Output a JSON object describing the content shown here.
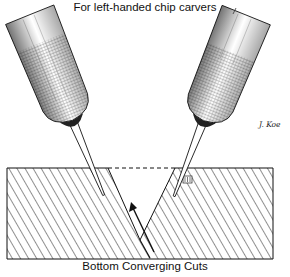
{
  "figure": {
    "title": "For left-handed chip carvers",
    "caption": "Bottom Converging Cuts",
    "signature": "J. Koe",
    "colors": {
      "ink": "#111111",
      "paper": "#ffffff"
    },
    "elements": [
      {
        "name": "left-knife",
        "description": "Knife handle tilted, blade pointing down-right into wood"
      },
      {
        "name": "right-knife",
        "description": "Knife handle tilted, blade pointing down-left into wood"
      },
      {
        "name": "wood-block",
        "description": "Hatched cross-section of wood with V-shaped notch"
      },
      {
        "name": "grain-mark",
        "description": "Small grain-direction symbol on block"
      },
      {
        "name": "convergence-arrow",
        "description": "Arrow pointing up along the converging cut line"
      }
    ]
  }
}
